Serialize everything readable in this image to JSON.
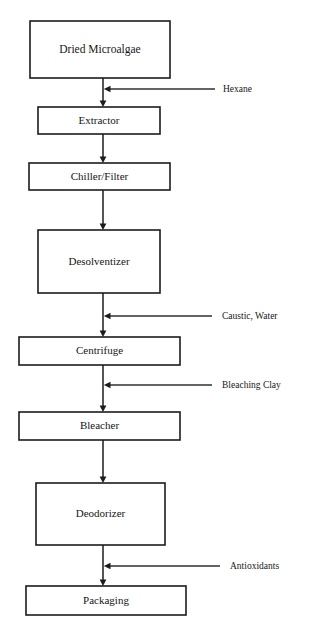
{
  "diagram": {
    "type": "process-flowchart",
    "orientation": "vertical",
    "background_color": "#ffffff",
    "line_color": "#1c1c1c",
    "text_color": "#161616",
    "spine_x": 103,
    "process_steps": [
      {
        "id": "dried-microalgae",
        "label": "Dried Microalgae",
        "x": 30,
        "y": 21,
        "width": 140,
        "height": 57,
        "font_size": 11.5
      },
      {
        "id": "extractor",
        "label": "Extractor",
        "x": 38,
        "y": 107,
        "width": 122,
        "height": 27,
        "font_size": 11
      },
      {
        "id": "chiller-filter",
        "label": "Chiller/Filter",
        "x": 29,
        "y": 163,
        "width": 141,
        "height": 27,
        "font_size": 11
      },
      {
        "id": "desolventizer",
        "label": "Desolventizer",
        "x": 38,
        "y": 230,
        "width": 122,
        "height": 63,
        "font_size": 11
      },
      {
        "id": "centrifuge",
        "label": "Centrifuge",
        "x": 19,
        "y": 337,
        "width": 161,
        "height": 28,
        "font_size": 11
      },
      {
        "id": "bleacher",
        "label": "Bleacher",
        "x": 19,
        "y": 412,
        "width": 161,
        "height": 28,
        "font_size": 11
      },
      {
        "id": "deodorizer",
        "label": "Deodorizer",
        "x": 36,
        "y": 483,
        "width": 129,
        "height": 62,
        "font_size": 11
      },
      {
        "id": "packaging",
        "label": "Packaging",
        "x": 26,
        "y": 586,
        "width": 160,
        "height": 29,
        "font_size": 11
      }
    ],
    "connectors": [
      {
        "id": "conn-dried-to-extractor",
        "from": "dried-microalgae",
        "to": "extractor",
        "x": 103,
        "y1": 78,
        "y2": 107
      },
      {
        "id": "conn-extractor-to-chiller",
        "from": "extractor",
        "to": "chiller-filter",
        "x": 103,
        "y1": 134,
        "y2": 163
      },
      {
        "id": "conn-chiller-to-desolventizer",
        "from": "chiller-filter",
        "to": "desolventizer",
        "x": 103,
        "y1": 190,
        "y2": 230
      },
      {
        "id": "conn-desolventizer-to-centrifuge",
        "from": "desolventizer",
        "to": "centrifuge",
        "x": 103,
        "y1": 293,
        "y2": 337
      },
      {
        "id": "conn-centrifuge-to-bleacher",
        "from": "centrifuge",
        "to": "bleacher",
        "x": 103,
        "y1": 365,
        "y2": 412
      },
      {
        "id": "conn-bleacher-to-deodorizer",
        "from": "bleacher",
        "to": "deodorizer",
        "x": 103,
        "y1": 440,
        "y2": 483
      },
      {
        "id": "conn-deodorizer-to-packaging",
        "from": "deodorizer",
        "to": "packaging",
        "x": 103,
        "y1": 545,
        "y2": 586
      }
    ],
    "input_streams": [
      {
        "id": "hexane",
        "label": "Hexane",
        "y": 89,
        "line_start_x": 215,
        "line_end_x": 103,
        "text_x": 223,
        "enters_before": "extractor"
      },
      {
        "id": "caustic-water",
        "label": "Caustic, Water",
        "y": 316,
        "line_start_x": 212,
        "line_end_x": 103,
        "text_x": 222,
        "enters_before": "centrifuge"
      },
      {
        "id": "bleaching-clay",
        "label": "Bleaching Clay",
        "y": 385,
        "line_start_x": 212,
        "line_end_x": 103,
        "text_x": 222,
        "enters_before": "bleacher"
      },
      {
        "id": "antioxidants",
        "label": "Antioxidants",
        "y": 566,
        "line_start_x": 220,
        "line_end_x": 103,
        "text_x": 230,
        "enters_before": "packaging"
      }
    ]
  }
}
